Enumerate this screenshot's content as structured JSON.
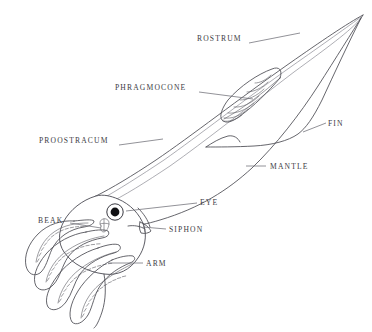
{
  "figure": {
    "background_color": "#ffffff",
    "ink_color": "#4a4a52",
    "label_color": "#3c3c44",
    "width": 372,
    "height": 332
  },
  "labels": {
    "rostrum": "ROSTRUM",
    "phragmocone": "PHRAGMOCONE",
    "proostracum": "PROOSTRACUM",
    "fin": "FIN",
    "mantle": "MANTLE",
    "eye": "EYE",
    "siphon": "SIPHON",
    "beak": "BEAK",
    "arm": "ARM"
  },
  "parts": [
    {
      "id": "rostrum",
      "label": "ROSTRUM",
      "label_x": 197,
      "label_y": 40,
      "side": "left",
      "leader_from": [
        249,
        43
      ],
      "leader_to": [
        300,
        33
      ]
    },
    {
      "id": "phragmocone",
      "label": "PHRAGMOCONE",
      "label_x": 115,
      "label_y": 89,
      "side": "left",
      "leader_from": [
        199,
        92
      ],
      "leader_to": [
        253,
        99
      ]
    },
    {
      "id": "proostracum",
      "label": "PROOSTRACUM",
      "label_x": 39,
      "label_y": 142,
      "side": "left",
      "leader_from": [
        119,
        145
      ],
      "leader_to": [
        163,
        139
      ]
    },
    {
      "id": "fin",
      "label": "FIN",
      "label_x": 328,
      "label_y": 125,
      "side": "right",
      "leader_from": [
        326,
        123
      ],
      "leader_to": [
        303,
        132
      ]
    },
    {
      "id": "mantle",
      "label": "MANTLE",
      "label_x": 270,
      "label_y": 168,
      "side": "right",
      "leader_from": [
        266,
        166
      ],
      "leader_to": [
        246,
        166
      ]
    },
    {
      "id": "eye",
      "label": "EYE",
      "label_x": 200,
      "label_y": 204,
      "side": "right",
      "leader_from": [
        197,
        203
      ],
      "leader_to": [
        126,
        211
      ]
    },
    {
      "id": "siphon",
      "label": "SIPHON",
      "label_x": 169,
      "label_y": 231,
      "side": "right",
      "leader_from": [
        166,
        229
      ],
      "leader_to": [
        143,
        227
      ]
    },
    {
      "id": "beak",
      "label": "BEAK",
      "label_x": 38,
      "label_y": 222,
      "side": "left",
      "leader_from": [
        70,
        223
      ],
      "leader_to": [
        101,
        228
      ]
    },
    {
      "id": "arm",
      "label": "ARM",
      "label_x": 146,
      "label_y": 265,
      "side": "right",
      "leader_from": [
        143,
        263
      ],
      "leader_to": [
        108,
        263
      ]
    }
  ],
  "anatomy_notes": {
    "eye_center": [
      115,
      212
    ],
    "eye_pupil_radius": 4.4,
    "eye_ring_radius": 8.2,
    "rostrum_tip": [
      363,
      15
    ],
    "arm_count": 5,
    "phragmocone_chamber_lines": 7
  }
}
